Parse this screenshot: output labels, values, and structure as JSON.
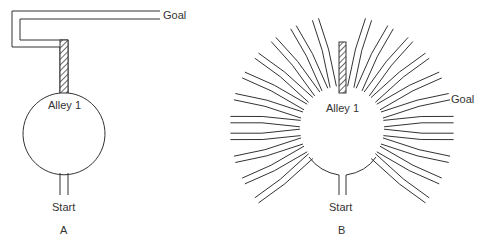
{
  "panel_a": {
    "alley_label": "Alley 1",
    "goal_label": "Goal",
    "start_label": "Start",
    "panel_label": "A"
  },
  "panel_b": {
    "alley_label": "Alley 1",
    "goal_label": "Goal",
    "start_label": "Start",
    "panel_label": "B",
    "arm_angles_deg": [
      -78,
      -66,
      -54,
      -42,
      -30,
      -18,
      -6,
      6,
      18,
      30,
      42,
      -102,
      -114,
      -126,
      -138,
      -150,
      -162,
      -174,
      174,
      162,
      150,
      138
    ],
    "colors": {
      "line": "#333333",
      "hatch": "#444444"
    }
  }
}
